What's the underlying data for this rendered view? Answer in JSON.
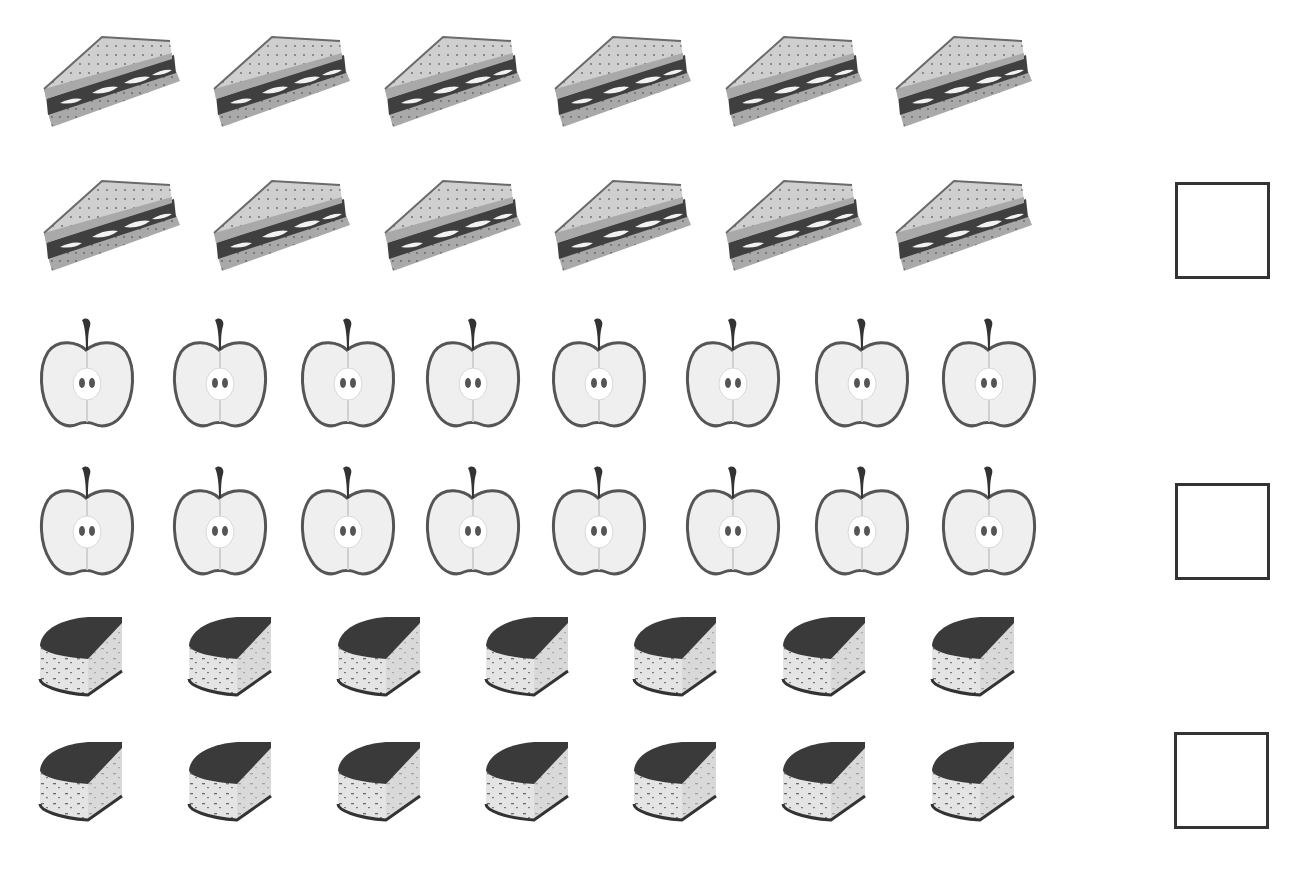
{
  "worksheet": {
    "title": "Count the food items",
    "groups": [
      {
        "name": "sandwiches",
        "icon": "sandwich-icon",
        "rows": [
          {
            "count": 6,
            "y": 33,
            "x_positions": [
              40,
              210,
              381,
              551,
              722,
              892
            ]
          },
          {
            "count": 6,
            "y": 177,
            "x_positions": [
              40,
              210,
              381,
              551,
              722,
              892
            ]
          }
        ],
        "total": 12,
        "answer_box": {
          "value": "",
          "x": 1175,
          "y": 182
        }
      },
      {
        "name": "apples",
        "icon": "apple-icon",
        "rows": [
          {
            "count": 8,
            "y": 316,
            "x_positions": [
              38,
              171,
              299,
              424,
              550,
              684,
              813,
              940
            ]
          },
          {
            "count": 8,
            "y": 464,
            "x_positions": [
              38,
              171,
              299,
              424,
              550,
              684,
              813,
              940
            ]
          }
        ],
        "total": 16,
        "answer_box": {
          "value": "",
          "x": 1175,
          "y": 483
        }
      },
      {
        "name": "cakes",
        "icon": "cake-slice-icon",
        "rows": [
          {
            "count": 7,
            "y": 615,
            "x_positions": [
              38,
              187,
              336,
              484,
              632,
              781,
              930
            ]
          },
          {
            "count": 7,
            "y": 740,
            "x_positions": [
              38,
              187,
              336,
              484,
              632,
              781,
              930
            ]
          }
        ],
        "total": 14,
        "answer_box": {
          "value": "",
          "x": 1174,
          "y": 732
        }
      }
    ]
  },
  "colors": {
    "background": "#ffffff",
    "bread": "#c8c8c8",
    "crust": "#8a8a8a",
    "filling": "#3f3f3f",
    "apple_flesh": "#eeeeee",
    "apple_outline": "#555555",
    "cake_top": "#3a3a3a",
    "cake_side": "#e2e2e2",
    "box_border": "#333333"
  }
}
